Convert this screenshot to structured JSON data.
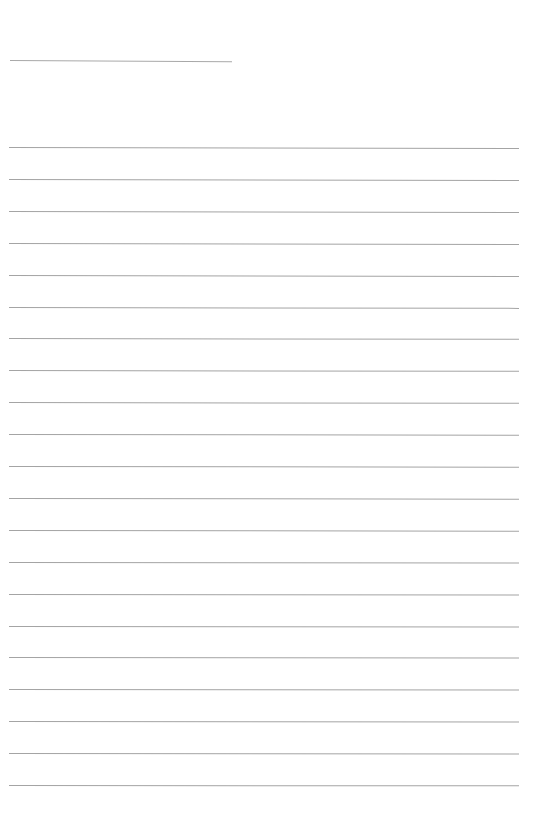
{
  "page": {
    "type": "lined-paper",
    "background_color": "#ffffff",
    "line_color": "#a4a4a4",
    "title_line": {
      "x": 10,
      "y": 60,
      "width": 222
    },
    "rules": {
      "count": 21,
      "start_y": 147,
      "spacing": 31.9,
      "x": 9,
      "width": 510
    }
  }
}
